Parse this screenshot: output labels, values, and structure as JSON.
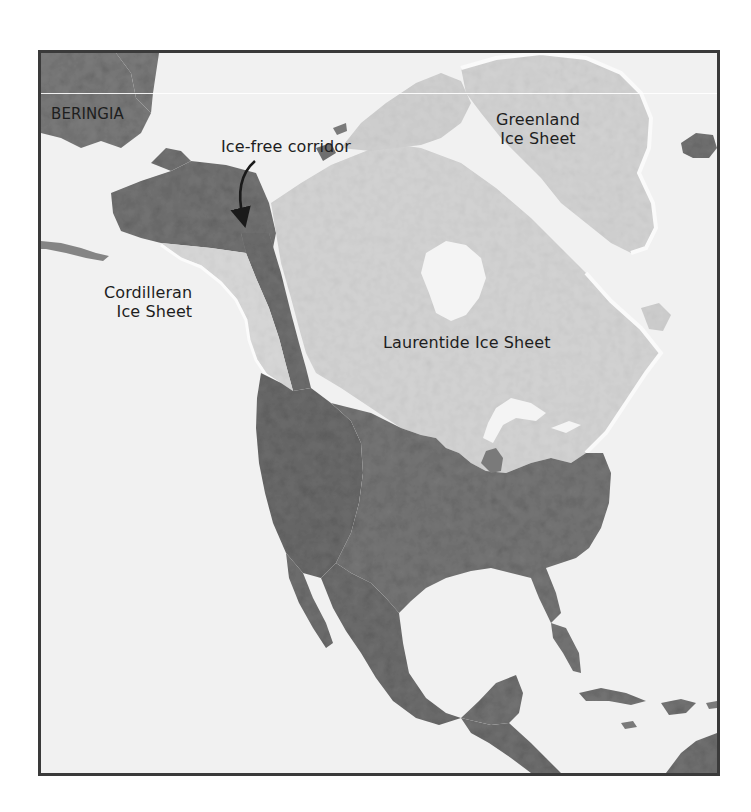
{
  "map": {
    "title": "Ice sheets of North America at the Last Glacial Maximum",
    "labels": {
      "beringia": "BERINGIA",
      "ice_free_corridor": "Ice-free corridor",
      "greenland": [
        "Greenland",
        "Ice Sheet"
      ],
      "cordilleran": [
        "Cordilleran",
        "Ice Sheet"
      ],
      "laurentide": "Laurentide Ice Sheet"
    },
    "legend_colors": {
      "ocean": "#f1f1f1",
      "ice_sheet": "#d4d4d4",
      "ice_free_land": "#787878",
      "ice_margin": "#fbfbfb",
      "frame": "#3a3a3a"
    },
    "annotations": [
      {
        "type": "arrow",
        "from": "Ice-free corridor label",
        "to": "corridor between Cordilleran and Laurentide ice sheets"
      }
    ]
  }
}
